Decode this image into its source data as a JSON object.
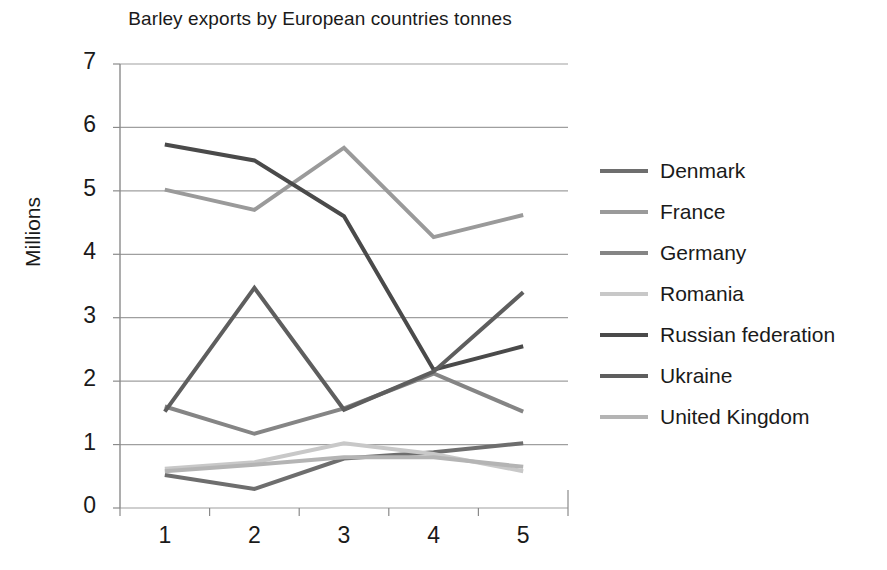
{
  "chart_data": {
    "type": "line",
    "title": "Barley exports by European countries tonnes",
    "xlabel": "",
    "ylabel": "Millions",
    "categories": [
      "1",
      "2",
      "3",
      "4",
      "5"
    ],
    "ylim": [
      0,
      7
    ],
    "yticks": [
      "0",
      "1",
      "2",
      "3",
      "4",
      "5",
      "6",
      "7"
    ],
    "grid": true,
    "legend_position": "right",
    "series": [
      {
        "name": "Denmark",
        "color": "#6e6e6e",
        "values": [
          0.52,
          0.3,
          0.78,
          0.88,
          1.02
        ]
      },
      {
        "name": "France",
        "color": "#9a9a9a",
        "values": [
          5.02,
          4.7,
          5.68,
          4.27,
          4.62
        ]
      },
      {
        "name": "Germany",
        "color": "#858585",
        "values": [
          1.6,
          1.17,
          1.57,
          2.12,
          1.52
        ]
      },
      {
        "name": "Romania",
        "color": "#c8c8c8",
        "values": [
          0.62,
          0.72,
          1.02,
          0.85,
          0.58
        ]
      },
      {
        "name": "Russian federation",
        "color": "#4a4a4a",
        "values": [
          5.73,
          5.48,
          4.6,
          2.18,
          2.55
        ]
      },
      {
        "name": "Ukraine",
        "color": "#5e5e5e",
        "values": [
          1.52,
          3.47,
          1.55,
          2.15,
          3.4
        ]
      },
      {
        "name": "United Kingdom",
        "color": "#b4b4b4",
        "values": [
          0.58,
          0.68,
          0.8,
          0.8,
          0.65
        ]
      }
    ]
  },
  "axes": {
    "plot_left": 120,
    "plot_right": 568,
    "plot_top": 64,
    "plot_bottom": 508,
    "grid_color": "#9f9f9f",
    "axis_color": "#8a8a8a"
  },
  "legend": {
    "items": [
      {
        "label": "Denmark"
      },
      {
        "label": "France"
      },
      {
        "label": "Germany"
      },
      {
        "label": "Romania"
      },
      {
        "label": "Russian federation"
      },
      {
        "label": "Ukraine"
      },
      {
        "label": "United Kingdom"
      }
    ]
  }
}
